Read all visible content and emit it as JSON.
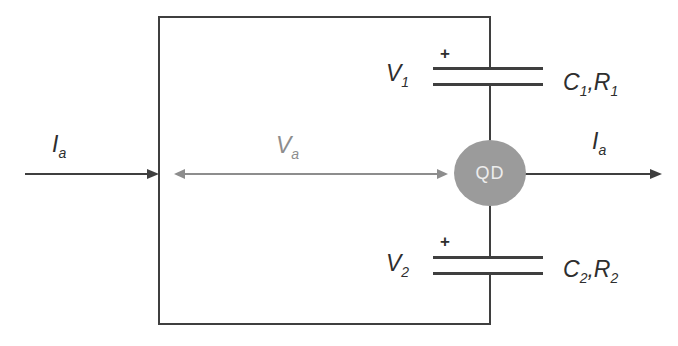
{
  "diagram": {
    "colors": {
      "wire": "#3f3f3f",
      "dimension_gray": "#8d8d8d",
      "dot_fill": "#9b9b9b",
      "dot_text": "#ededed",
      "label_text": "#2e2e2e",
      "background": "#ffffff"
    },
    "labels": {
      "current_in": {
        "base": "I",
        "sub": "a"
      },
      "current_out": {
        "base": "I",
        "sub": "a"
      },
      "voltage_across": {
        "base": "V",
        "sub": "a"
      },
      "v1": {
        "base": "V",
        "sub": "1"
      },
      "v2": {
        "base": "V",
        "sub": "2"
      },
      "cap1": {
        "c": "C",
        "c_sub": "1",
        "comma": ",",
        "r": "R",
        "r_sub": "1"
      },
      "cap2": {
        "c": "C",
        "c_sub": "2",
        "comma": ",",
        "r": "R",
        "r_sub": "2"
      },
      "plus_top": "+",
      "plus_bottom": "+",
      "quantum_dot": "QD"
    }
  }
}
